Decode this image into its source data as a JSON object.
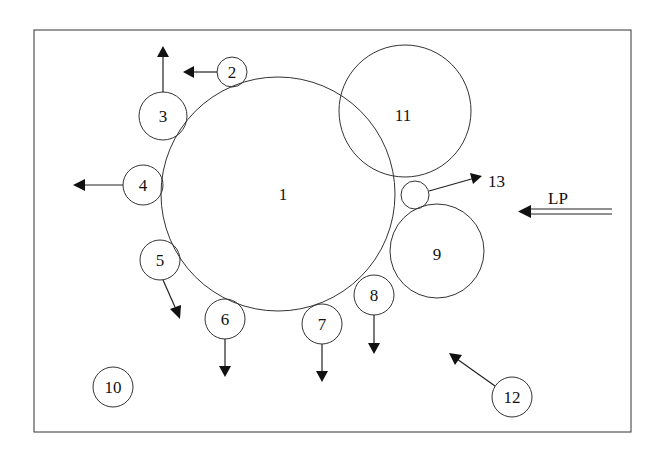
{
  "diagram": {
    "frame": {
      "x": 34,
      "y": 30,
      "width": 597,
      "height": 402
    },
    "circles": [
      {
        "id": "1",
        "label": "1",
        "cx": 278,
        "cy": 194,
        "r": 117
      },
      {
        "id": "2",
        "label": "2",
        "cx": 232,
        "cy": 72,
        "r": 15
      },
      {
        "id": "3",
        "label": "3",
        "cx": 163,
        "cy": 116,
        "r": 24
      },
      {
        "id": "4",
        "label": "4",
        "cx": 143,
        "cy": 185,
        "r": 20
      },
      {
        "id": "5",
        "label": "5",
        "cx": 160,
        "cy": 260,
        "r": 20
      },
      {
        "id": "6",
        "label": "6",
        "cx": 225,
        "cy": 319,
        "r": 20
      },
      {
        "id": "7",
        "label": "7",
        "cx": 322,
        "cy": 324,
        "r": 20
      },
      {
        "id": "8",
        "label": "8",
        "cx": 375,
        "cy": 295,
        "r": 20
      },
      {
        "id": "9",
        "label": "9",
        "cx": 437,
        "cy": 251,
        "r": 47
      },
      {
        "id": "10",
        "label": "10",
        "cx": 113,
        "cy": 387,
        "r": 20
      },
      {
        "id": "11",
        "label": "11",
        "cx": 405,
        "cy": 111,
        "r": 66
      },
      {
        "id": "13c",
        "label": "",
        "cx": 415,
        "cy": 195,
        "r": 14
      },
      {
        "id": "12",
        "label": "12",
        "cx": 512,
        "cy": 397,
        "r": 20
      }
    ],
    "labels": {
      "n13": "13",
      "lp": "LP"
    }
  }
}
